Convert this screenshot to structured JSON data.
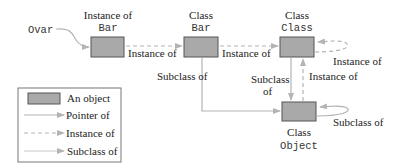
{
  "colors": {
    "object_fill": "#a9a9a9",
    "object_stroke": "#555555",
    "line": "#b4b4b4",
    "text": "#222222"
  },
  "nodes": {
    "instance_bar": {
      "label_top": "Instance of",
      "label_code": "Bar"
    },
    "class_bar": {
      "label_top": "Class",
      "label_code": "Bar"
    },
    "class_class": {
      "label_top": "Class",
      "label_code": "Class"
    },
    "class_object": {
      "label_top": "Class",
      "label_code": "Object"
    }
  },
  "variable": {
    "name": "Ovar"
  },
  "edges": {
    "inst_to_bar": "Instance of",
    "bar_to_class": "Instance of",
    "class_self": "Instance of",
    "bar_subclass_object": "Subclass of",
    "class_subclass_object_line1": "Subclass",
    "class_subclass_object_line2": "of",
    "object_instance_class": "Instance of",
    "object_self": "Subclass of"
  },
  "legend": {
    "items": [
      {
        "type": "object",
        "label": "An object"
      },
      {
        "type": "pointer",
        "label": "Pointer of"
      },
      {
        "type": "instance",
        "label": "Instance of"
      },
      {
        "type": "subclass",
        "label": "Subclass of"
      }
    ]
  }
}
